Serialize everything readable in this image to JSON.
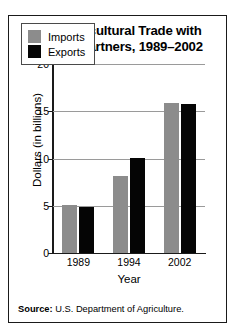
{
  "figure": {
    "title_line1": "U.S. Agricultural Trade with",
    "title_line2": "NAFTA Partners, 1989–2002",
    "source_label": "Source:",
    "source_text": "U.S. Department of Agriculture."
  },
  "colors": {
    "imports": "#8c8c8c",
    "exports": "#050505",
    "border": "#1a1a1a",
    "gridline": "#9a9a9a",
    "background": "#ffffff"
  },
  "chart_data": {
    "type": "bar",
    "title": "U.S. Agricultural Trade with NAFTA Partners, 1989–2002",
    "xlabel": "Year",
    "ylabel": "Dollars (in billions)",
    "categories": [
      "1989",
      "1994",
      "2002"
    ],
    "series": [
      {
        "name": "Imports",
        "color": "#8c8c8c",
        "values": [
          5.1,
          8.1,
          15.9
        ]
      },
      {
        "name": "Exports",
        "color": "#050505",
        "values": [
          4.9,
          10.1,
          15.8
        ]
      }
    ],
    "ylim": [
      0,
      20
    ],
    "yticks": [
      0,
      5,
      10,
      15,
      20
    ],
    "ytick_labels": [
      "0",
      "5",
      "10",
      "15",
      "20"
    ],
    "grid": true,
    "legend_position": "top-left",
    "legend_entries": [
      "Imports",
      "Exports"
    ]
  }
}
